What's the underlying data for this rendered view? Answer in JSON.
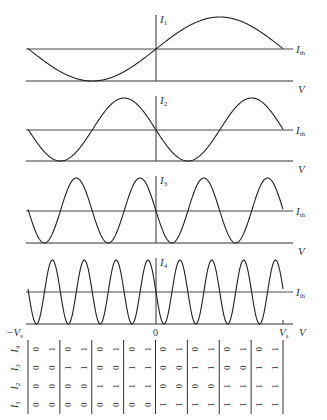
{
  "chart_data": {
    "type": "line",
    "title": "",
    "xlabel": "V",
    "x_ticks": [
      "-Vs",
      "0",
      "Vs"
    ],
    "threshold_label": "Ith",
    "panels": [
      {
        "name": "I1",
        "periods_in_range": 1,
        "label": "I1"
      },
      {
        "name": "I2",
        "periods_in_range": 2,
        "label": "I2"
      },
      {
        "name": "I3",
        "periods_in_range": 4,
        "label": "I3"
      },
      {
        "name": "I4",
        "periods_in_range": 8,
        "label": "I4"
      }
    ],
    "code_table": {
      "rows": [
        {
          "label": "I4",
          "values": [
            0,
            1,
            0,
            1,
            0,
            1,
            0,
            1,
            0,
            1,
            0,
            1,
            0,
            1,
            0,
            1
          ]
        },
        {
          "label": "I3",
          "values": [
            0,
            0,
            1,
            1,
            0,
            0,
            1,
            1,
            0,
            0,
            1,
            1,
            0,
            0,
            1,
            1
          ]
        },
        {
          "label": "I2",
          "values": [
            0,
            0,
            0,
            0,
            1,
            1,
            1,
            1,
            0,
            0,
            0,
            0,
            1,
            1,
            1,
            1
          ]
        },
        {
          "label": "I1",
          "values": [
            0,
            0,
            0,
            0,
            0,
            0,
            0,
            0,
            1,
            1,
            1,
            1,
            1,
            1,
            1,
            1
          ]
        }
      ]
    }
  },
  "labels": {
    "panel1": {
      "main": "I",
      "sub": "1"
    },
    "panel2": {
      "main": "I",
      "sub": "2"
    },
    "panel3": {
      "main": "I",
      "sub": "3"
    },
    "panel4": {
      "main": "I",
      "sub": "4"
    },
    "threshold": {
      "main": "I",
      "sub": "th"
    },
    "v_axis": "V",
    "neg_vs": {
      "main": "−V",
      "sub": "s"
    },
    "zero": "0",
    "pos_vs": {
      "main": "V",
      "sub": "s"
    }
  }
}
